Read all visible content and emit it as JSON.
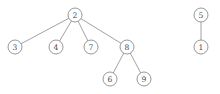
{
  "diagram": {
    "type": "forest-graph",
    "title": "",
    "canvas": {
      "width": 220,
      "height": 94,
      "background": "#ffffff"
    },
    "style": {
      "node_radius": 7,
      "node_fill": "#ffffff",
      "node_stroke": "#7d7d7d",
      "edge_stroke": "#8a8a8a",
      "label_color": "#4a4a4a"
    },
    "nodes": [
      {
        "id": "n2",
        "label": "2",
        "x": 75,
        "y": 15
      },
      {
        "id": "n3",
        "label": "3",
        "x": 15,
        "y": 47
      },
      {
        "id": "n4",
        "label": "4",
        "x": 56,
        "y": 47
      },
      {
        "id": "n7",
        "label": "7",
        "x": 91,
        "y": 47
      },
      {
        "id": "n8",
        "label": "8",
        "x": 127,
        "y": 47
      },
      {
        "id": "n6",
        "label": "6",
        "x": 110,
        "y": 79
      },
      {
        "id": "n9",
        "label": "9",
        "x": 144,
        "y": 79
      },
      {
        "id": "n5",
        "label": "5",
        "x": 201,
        "y": 15
      },
      {
        "id": "n1",
        "label": "1",
        "x": 201,
        "y": 47
      }
    ],
    "edges": [
      {
        "id": "e2-3",
        "from": "n2",
        "to": "n3"
      },
      {
        "id": "e2-4",
        "from": "n2",
        "to": "n4"
      },
      {
        "id": "e2-7",
        "from": "n2",
        "to": "n7"
      },
      {
        "id": "e2-8",
        "from": "n2",
        "to": "n8"
      },
      {
        "id": "e8-6",
        "from": "n8",
        "to": "n6"
      },
      {
        "id": "e8-9",
        "from": "n8",
        "to": "n9"
      },
      {
        "id": "e5-1",
        "from": "n5",
        "to": "n1"
      }
    ]
  }
}
